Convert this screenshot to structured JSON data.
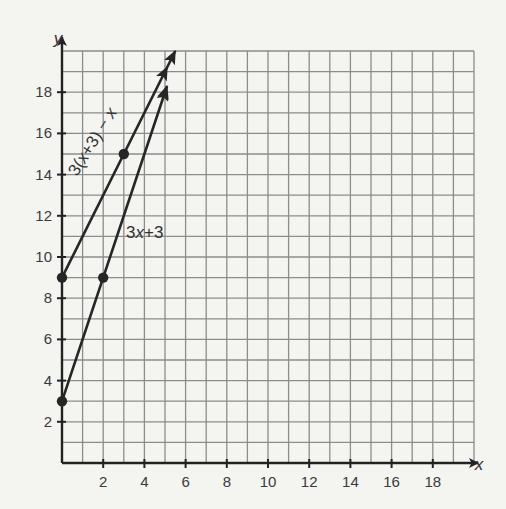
{
  "chart_data": {
    "type": "line",
    "title": "",
    "xlabel": "x",
    "ylabel": "y",
    "xlim": [
      0,
      20
    ],
    "ylim": [
      0,
      20
    ],
    "grid": true,
    "x_ticks": [
      2,
      4,
      6,
      8,
      10,
      12,
      14,
      16,
      18
    ],
    "y_ticks": [
      2,
      4,
      6,
      8,
      10,
      12,
      14,
      16,
      18
    ],
    "series": [
      {
        "name": "3(x+3) − x",
        "label_html": "3(x+3) − x",
        "equation_simplified": "y = 2x + 9",
        "points": [
          [
            0,
            9
          ],
          [
            3,
            15
          ],
          [
            5,
            19
          ]
        ],
        "line_end": [
          5.5,
          20
        ],
        "arrow": true
      },
      {
        "name": "3x+3",
        "label_html": "3x+3",
        "equation_simplified": "y = 3x + 3",
        "points": [
          [
            0,
            3
          ],
          [
            2,
            9
          ],
          [
            5,
            18
          ]
        ],
        "line_end": [
          5.1,
          18.3
        ],
        "arrow": true
      }
    ],
    "legend": "inline labels along lines"
  },
  "labels": {
    "x_axis": "x",
    "y_axis": "y",
    "series_0": "3(x+3) − x",
    "series_1": "3x+3"
  },
  "colors": {
    "background": "#f4f4f1",
    "grid": "#8c8c8c",
    "axis": "#222222",
    "line": "#262626",
    "text": "#3a3a3a"
  }
}
